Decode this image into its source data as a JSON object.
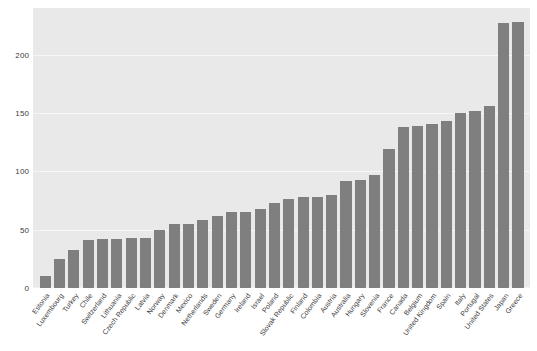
{
  "chart_data": {
    "type": "bar",
    "title": "",
    "subtitle": "",
    "xlabel": "",
    "ylabel": "",
    "ylim": [
      0,
      240
    ],
    "yticks": [
      0,
      50,
      100,
      150,
      200
    ],
    "ytick_labels": [
      "0",
      "50",
      "100",
      "150",
      "200"
    ],
    "grid": true,
    "legend": false,
    "legend_position": "none",
    "orientation": "vertical",
    "sorted": "ascending",
    "bar_color": "#7f7f7f",
    "plot_background": "#e9e9e9",
    "figure_background": "#ffffff",
    "gridline_color": "#f7f7f7",
    "tick_label_color": "#3d3d3d",
    "xtick_rotation": -53,
    "categories": [
      "Estonia",
      "Luxembourg",
      "Turkey",
      "Chile",
      "Switzerland",
      "Lithuania",
      "Czech Republic",
      "Latvia",
      "Norway",
      "Denmark",
      "Mexico",
      "Netherlands",
      "Sweden",
      "Germany",
      "Ireland",
      "Israel",
      "Poland",
      "Slovak Republic",
      "Finland",
      "Colombia",
      "Austria",
      "Australia",
      "Hungary",
      "Slovenia",
      "France",
      "Canada",
      "Belgium",
      "United Kingdom",
      "Spain",
      "Italy",
      "Portugal",
      "United States",
      "Japan",
      "Greece"
    ],
    "values": [
      10,
      25,
      33,
      41,
      42,
      42,
      43,
      43,
      50,
      55,
      55,
      58,
      62,
      65,
      65,
      68,
      73,
      76,
      78,
      78,
      80,
      92,
      93,
      97,
      119,
      138,
      139,
      141,
      143,
      150,
      152,
      156,
      227,
      228
    ]
  }
}
